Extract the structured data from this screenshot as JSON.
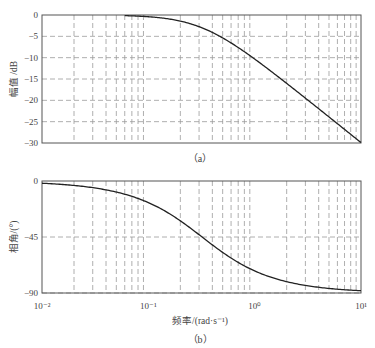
{
  "chart_data": [
    {
      "type": "line",
      "title": "",
      "caption": "（a）",
      "xlabel": "",
      "ylabel": "幅值 /dB",
      "xscale": "log",
      "xlim": [
        0.01,
        10
      ],
      "ylim": [
        -30,
        0
      ],
      "yticks": [
        0,
        -5,
        -10,
        -15,
        -20,
        -25,
        -30
      ],
      "ytick_labels": [
        "0",
        "−5",
        "−10",
        "−15",
        "−20",
        "−25",
        "−30"
      ],
      "grid": true,
      "series": [
        {
          "name": "magnitude",
          "x": [
            0.06,
            0.1,
            0.2,
            0.32,
            0.5,
            1,
            2,
            5,
            10
          ],
          "y": [
            -0.15,
            -0.4,
            -1.4,
            -3.0,
            -5.5,
            -10.4,
            -16.0,
            -23.9,
            -29.9
          ]
        }
      ]
    },
    {
      "type": "line",
      "title": "",
      "caption": "（b）",
      "xlabel": "频率/(rad·s⁻¹)",
      "ylabel": "相角/(°)",
      "xscale": "log",
      "xlim": [
        0.01,
        10
      ],
      "ylim": [
        -90,
        0
      ],
      "xticks": [
        0.01,
        0.1,
        1,
        10
      ],
      "xtick_labels": [
        "10⁻²",
        "10⁻¹",
        "10⁰",
        "10¹"
      ],
      "yticks": [
        0,
        -45,
        -90
      ],
      "ytick_labels": [
        "0",
        "−45",
        "−90"
      ],
      "grid": true,
      "series": [
        {
          "name": "phase",
          "x": [
            0.01,
            0.02,
            0.05,
            0.1,
            0.2,
            0.32,
            0.5,
            1,
            2,
            5,
            10
          ],
          "y": [
            -1.8,
            -3.6,
            -8.9,
            -17.4,
            -32.0,
            -45.0,
            -57.4,
            -72.3,
            -81.0,
            -86.3,
            -88.2
          ]
        }
      ]
    }
  ],
  "labels": {
    "top_ylabel": "幅值 /dB",
    "bottom_ylabel": "相角/(°)",
    "xlabel": "频率/(rad·s⁻¹)",
    "caption_a": "（a）",
    "caption_b": "（b）"
  },
  "corner_frequency": 0.32
}
